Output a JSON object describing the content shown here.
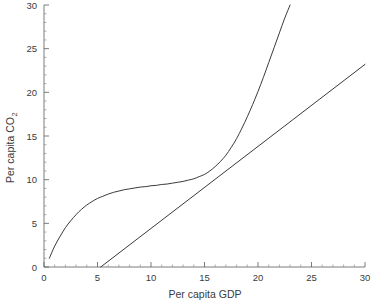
{
  "chart_data": {
    "type": "line",
    "title": "",
    "subtitle": "",
    "xlabel": "Per capita GDP",
    "ylabel_main": "Per capita CO",
    "ylabel_sub": "2",
    "ylabel_full": "Per capita CO2",
    "xlim": [
      0,
      30
    ],
    "ylim": [
      0,
      30
    ],
    "xticks": [
      0,
      5,
      10,
      15,
      20,
      25,
      30
    ],
    "xtick_labels": [
      "0",
      "5",
      "10",
      "15",
      "20",
      "25",
      "30"
    ],
    "yticks": [
      0,
      5,
      10,
      15,
      20,
      25,
      30
    ],
    "ytick_labels": [
      "0",
      "5",
      "10",
      "15",
      "20",
      "25",
      "30"
    ],
    "x_minor_tick_step": 1,
    "y_minor_tick_step": 1,
    "grid": false,
    "legend": false,
    "legend_position": "none",
    "annotations": [],
    "line_color": "#3a3a3a",
    "axis_color": "#5a5a5a",
    "background_color": "#ffffff",
    "series": [
      {
        "name": "S-shaped environmental Kuznets style curve",
        "style": "solid",
        "points": [
          [
            0.5,
            1.0
          ],
          [
            1.0,
            2.4
          ],
          [
            1.5,
            3.5
          ],
          [
            2.0,
            4.5
          ],
          [
            2.5,
            5.3
          ],
          [
            3.0,
            6.0
          ],
          [
            3.5,
            6.6
          ],
          [
            4.0,
            7.1
          ],
          [
            4.5,
            7.5
          ],
          [
            5.0,
            7.85
          ],
          [
            5.5,
            8.1
          ],
          [
            6.0,
            8.35
          ],
          [
            6.5,
            8.55
          ],
          [
            7.0,
            8.7
          ],
          [
            7.5,
            8.85
          ],
          [
            8.0,
            8.95
          ],
          [
            8.5,
            9.05
          ],
          [
            9.0,
            9.15
          ],
          [
            9.5,
            9.2
          ],
          [
            10.0,
            9.3
          ],
          [
            10.5,
            9.35
          ],
          [
            11.0,
            9.45
          ],
          [
            11.5,
            9.5
          ],
          [
            12.0,
            9.6
          ],
          [
            12.5,
            9.7
          ],
          [
            13.0,
            9.8
          ],
          [
            13.5,
            9.95
          ],
          [
            14.0,
            10.1
          ],
          [
            14.5,
            10.35
          ],
          [
            15.0,
            10.6
          ],
          [
            15.5,
            11.0
          ],
          [
            16.0,
            11.5
          ],
          [
            16.5,
            12.1
          ],
          [
            17.0,
            12.8
          ],
          [
            17.5,
            13.7
          ],
          [
            18.0,
            14.7
          ],
          [
            18.5,
            15.9
          ],
          [
            19.0,
            17.2
          ],
          [
            19.5,
            18.6
          ],
          [
            20.0,
            20.1
          ],
          [
            20.5,
            21.7
          ],
          [
            21.0,
            23.4
          ],
          [
            21.5,
            25.1
          ],
          [
            22.0,
            26.8
          ],
          [
            22.5,
            28.5
          ],
          [
            23.0,
            30.0
          ]
        ]
      },
      {
        "name": "Straight reference line",
        "style": "solid",
        "points": [
          [
            5.3,
            0.0
          ],
          [
            30.0,
            23.2
          ]
        ]
      }
    ]
  }
}
